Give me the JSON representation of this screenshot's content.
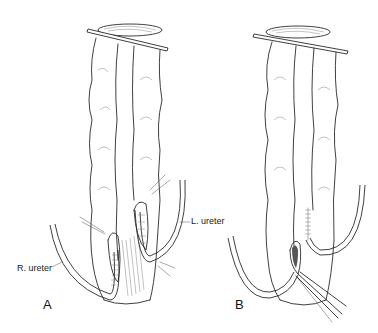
{
  "figure": {
    "panels": [
      {
        "id": "A",
        "letter": "A",
        "labels": {
          "right_ureter": "R. ureter",
          "left_ureter": "L. ureter"
        }
      },
      {
        "id": "B",
        "letter": "B"
      }
    ]
  }
}
